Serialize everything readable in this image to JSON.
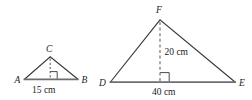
{
  "figure": {
    "background_color": "#ffffff",
    "stroke_color": "#3a3a3a",
    "base_stroke_color": "#6e6e70",
    "text_color": "#1b1b1b"
  },
  "triangles": [
    {
      "id": "small-triangle",
      "name": "triangle-abc",
      "vertices": [
        {
          "key": "A",
          "label": "A",
          "role": "base-left"
        },
        {
          "key": "B",
          "label": "B",
          "role": "base-right"
        },
        {
          "key": "C",
          "label": "C",
          "role": "apex"
        }
      ],
      "base_label": "15 cm",
      "base_value": 15,
      "base_unit": "cm",
      "height_label": "",
      "has_right_angle_mark": true,
      "has_altitude": true,
      "altitude_style": "dashed"
    },
    {
      "id": "large-triangle",
      "name": "triangle-def",
      "vertices": [
        {
          "key": "D",
          "label": "D",
          "role": "base-left"
        },
        {
          "key": "E",
          "label": "E",
          "role": "base-right"
        },
        {
          "key": "F",
          "label": "F",
          "role": "apex"
        }
      ],
      "base_label": "40 cm",
      "base_value": 40,
      "base_unit": "cm",
      "height_label": "20 cm",
      "height_value": 20,
      "height_unit": "cm",
      "has_right_angle_mark": true,
      "has_altitude": true,
      "altitude_style": "dashed"
    }
  ],
  "labels": {
    "small": {
      "vertex_a": "A",
      "vertex_b": "B",
      "vertex_c": "C",
      "base": "15 cm"
    },
    "large": {
      "vertex_d": "D",
      "vertex_e": "E",
      "vertex_f": "F",
      "base": "40 cm",
      "height": "20 cm"
    }
  }
}
